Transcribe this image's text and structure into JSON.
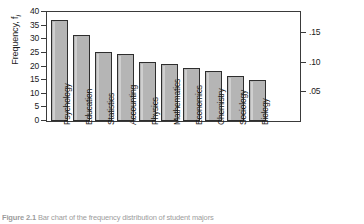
{
  "figure": {
    "caption_label": "Figure 2.1",
    "caption_text": "Bar chart of the frequency distribution of student majors"
  },
  "chart_data": {
    "type": "bar",
    "title": "",
    "xlabel": "",
    "ylabel": "Frequency, f",
    "ylabel_sub": "i",
    "ylabel_right": "Relative frequency, p",
    "ylabel_right_sub": "i",
    "categories": [
      "Psychology",
      "Education",
      "Statistics",
      "Accounting",
      "Physics",
      "Mathematics",
      "Economics",
      "Chemistry",
      "Sociology",
      "Biology"
    ],
    "values": [
      37,
      31.5,
      25.3,
      24.5,
      21.8,
      21.0,
      19.5,
      18.3,
      16.7,
      15.0
    ],
    "relative_values": [
      0.173,
      0.147,
      0.118,
      0.114,
      0.102,
      0.098,
      0.091,
      0.085,
      0.078,
      0.07
    ],
    "ylim": [
      0,
      40
    ],
    "yticks": [
      0,
      5,
      10,
      15,
      20,
      25,
      30,
      35,
      40
    ],
    "ytick_labels": [
      "0",
      "5",
      "10",
      "15",
      "20",
      "25",
      "30",
      "35",
      "40"
    ],
    "ylim_right": [
      0,
      0.1866
    ],
    "yticks_right": [
      0.05,
      0.1,
      0.15
    ],
    "ytick_labels_right": [
      ".05",
      ".10",
      ".15"
    ],
    "grid": false,
    "legend": "none",
    "bar_color": "#b5b5b5",
    "bar_edge_color": "#2e2e2e",
    "axis_color": "#3a3a3a",
    "background": "#ffffff"
  }
}
